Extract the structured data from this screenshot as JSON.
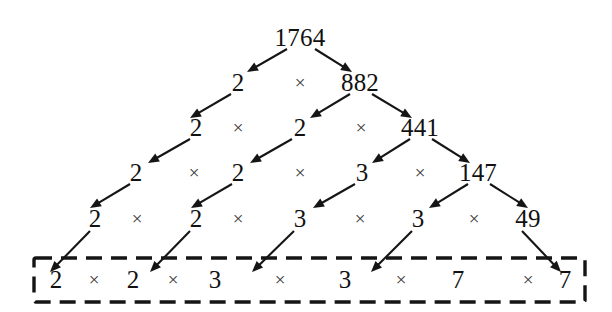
{
  "figure": {
    "type": "factor-tree-diagram",
    "root_value": "1764",
    "background_color": "#ffffff",
    "ink_color": "#111111",
    "operator_symbol": "×",
    "levels": [
      {
        "index": 1,
        "y": 37,
        "nodes": [
          {
            "text": "1764",
            "x": 300,
            "kind": "composite"
          }
        ],
        "operators": []
      },
      {
        "index": 2,
        "y": 82,
        "nodes": [
          {
            "text": "2",
            "x": 238,
            "kind": "prime"
          },
          {
            "text": "882",
            "x": 360,
            "kind": "composite"
          }
        ],
        "operators": [
          {
            "text": "×",
            "x": 300
          }
        ]
      },
      {
        "index": 3,
        "y": 127,
        "nodes": [
          {
            "text": "2",
            "x": 196,
            "kind": "prime"
          },
          {
            "text": "2",
            "x": 300,
            "kind": "prime"
          },
          {
            "text": "441",
            "x": 420,
            "kind": "composite"
          }
        ],
        "operators": [
          {
            "text": "×",
            "x": 238
          },
          {
            "text": "×",
            "x": 361
          }
        ]
      },
      {
        "index": 4,
        "y": 172,
        "nodes": [
          {
            "text": "2",
            "x": 136,
            "kind": "prime"
          },
          {
            "text": "2",
            "x": 238,
            "kind": "prime"
          },
          {
            "text": "3",
            "x": 362,
            "kind": "prime"
          },
          {
            "text": "147",
            "x": 478,
            "kind": "composite"
          }
        ],
        "operators": [
          {
            "text": "×",
            "x": 194
          },
          {
            "text": "×",
            "x": 300
          },
          {
            "text": "×",
            "x": 420
          }
        ]
      },
      {
        "index": 5,
        "y": 218,
        "nodes": [
          {
            "text": "2",
            "x": 95,
            "kind": "prime"
          },
          {
            "text": "2",
            "x": 196,
            "kind": "prime"
          },
          {
            "text": "3",
            "x": 300,
            "kind": "prime"
          },
          {
            "text": "3",
            "x": 418,
            "kind": "prime"
          },
          {
            "text": "49",
            "x": 528,
            "kind": "composite"
          }
        ],
        "operators": [
          {
            "text": "×",
            "x": 137
          },
          {
            "text": "×",
            "x": 238
          },
          {
            "text": "×",
            "x": 360
          },
          {
            "text": "×",
            "x": 474
          }
        ]
      },
      {
        "index": 6,
        "y": 279,
        "boxed": true,
        "nodes": [
          {
            "text": "2",
            "x": 56,
            "kind": "prime"
          },
          {
            "text": "2",
            "x": 133,
            "kind": "prime"
          },
          {
            "text": "3",
            "x": 215,
            "kind": "prime"
          },
          {
            "text": "3",
            "x": 345,
            "kind": "prime"
          },
          {
            "text": "7",
            "x": 458,
            "kind": "prime"
          },
          {
            "text": "7",
            "x": 565,
            "kind": "prime"
          }
        ],
        "operators": [
          {
            "text": "×",
            "x": 94
          },
          {
            "text": "×",
            "x": 173
          },
          {
            "text": "×",
            "x": 280
          },
          {
            "text": "×",
            "x": 401
          },
          {
            "text": "×",
            "x": 528
          }
        ]
      }
    ],
    "box": {
      "x": 34,
      "y": 258,
      "width": 551,
      "height": 44,
      "style": "dashed",
      "stroke_color": "#151515",
      "label": "prime-factorization-result"
    },
    "arrows": [
      {
        "from": "1764",
        "to": "2",
        "x1": 287,
        "y1": 49,
        "x2": 247,
        "y2": 72
      },
      {
        "from": "1764",
        "to": "882",
        "x1": 315,
        "y1": 49,
        "x2": 352,
        "y2": 72
      },
      {
        "from": "2-l2",
        "to": "2-l3",
        "x1": 231,
        "y1": 94,
        "x2": 190,
        "y2": 118
      },
      {
        "from": "882",
        "to": "2-l3",
        "x1": 350,
        "y1": 94,
        "x2": 310,
        "y2": 118
      },
      {
        "from": "882",
        "to": "441",
        "x1": 372,
        "y1": 94,
        "x2": 412,
        "y2": 118
      },
      {
        "from": "2-l3",
        "to": "2-l4",
        "x1": 190,
        "y1": 139,
        "x2": 148,
        "y2": 163
      },
      {
        "from": "2-l3",
        "to": "2-l4b",
        "x1": 292,
        "y1": 139,
        "x2": 250,
        "y2": 163
      },
      {
        "from": "441",
        "to": "3-l4",
        "x1": 410,
        "y1": 139,
        "x2": 372,
        "y2": 163
      },
      {
        "from": "441",
        "to": "147",
        "x1": 432,
        "y1": 139,
        "x2": 470,
        "y2": 163
      },
      {
        "from": "2-l4",
        "to": "2-l5",
        "x1": 130,
        "y1": 184,
        "x2": 90,
        "y2": 208
      },
      {
        "from": "2-l4b",
        "to": "2-l5b",
        "x1": 232,
        "y1": 184,
        "x2": 191,
        "y2": 208
      },
      {
        "from": "3-l4",
        "to": "3-l5",
        "x1": 355,
        "y1": 184,
        "x2": 313,
        "y2": 208
      },
      {
        "from": "147",
        "to": "3-l5b",
        "x1": 468,
        "y1": 184,
        "x2": 429,
        "y2": 208
      },
      {
        "from": "147",
        "to": "49",
        "x1": 490,
        "y1": 184,
        "x2": 528,
        "y2": 208
      },
      {
        "from": "2-l5",
        "to": "2-box",
        "x1": 90,
        "y1": 231,
        "x2": 50,
        "y2": 272
      },
      {
        "from": "2-l5b",
        "to": "2-box2",
        "x1": 190,
        "y1": 231,
        "x2": 150,
        "y2": 272
      },
      {
        "from": "3-l5",
        "to": "3-box",
        "x1": 294,
        "y1": 231,
        "x2": 252,
        "y2": 272
      },
      {
        "from": "3-l5b",
        "to": "3-box2",
        "x1": 412,
        "y1": 231,
        "x2": 371,
        "y2": 272
      },
      {
        "from": "49",
        "to": "7-box",
        "x1": 522,
        "y1": 231,
        "x2": 561,
        "y2": 272
      }
    ]
  },
  "chart_data": {
    "type": "diagram",
    "root": 1764,
    "factorization": [
      2,
      2,
      3,
      3,
      7,
      7
    ],
    "factorization_text": "2 × 2 × 3 × 3 × 7 × 7",
    "steps": [
      {
        "level": 1,
        "row_text": "1764"
      },
      {
        "level": 2,
        "row_text": "2 × 882"
      },
      {
        "level": 3,
        "row_text": "2 × 2 × 441"
      },
      {
        "level": 4,
        "row_text": "2 × 2 × 3 × 147"
      },
      {
        "level": 5,
        "row_text": "2 × 2 × 3 × 3 × 49"
      },
      {
        "level": 6,
        "row_text": "2 × 2 × 3 × 3 × 7 × 7"
      }
    ]
  }
}
